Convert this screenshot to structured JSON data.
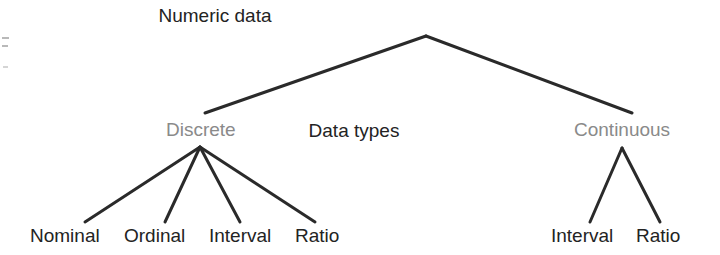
{
  "diagram": {
    "type": "tree",
    "title_node": "Numeric data",
    "center_label": "Data types",
    "branches": [
      {
        "label": "Discrete",
        "color": "#8a8a8a"
      },
      {
        "label": "Continuous",
        "color": "#8a8a8a"
      }
    ],
    "discrete_leaves": [
      {
        "label": "Nominal"
      },
      {
        "label": "Ordinal"
      },
      {
        "label": "Interval"
      },
      {
        "label": "Ratio"
      }
    ],
    "continuous_leaves": [
      {
        "label": "Interval"
      },
      {
        "label": "Ratio"
      }
    ],
    "colors": {
      "line": "#2a2a2a",
      "text": "#232323",
      "branch_text": "#8a8a8a",
      "background": "#ffffff",
      "artifact": "#b9b9b9"
    },
    "geometry": {
      "root_apex": {
        "x": 426,
        "y": 36
      },
      "discrete_top": {
        "x": 205,
        "y": 113
      },
      "continuous_top": {
        "x": 632,
        "y": 113
      },
      "discrete_fan_apex": {
        "x": 200,
        "y": 147
      },
      "continuous_fan_apex": {
        "x": 622,
        "y": 148
      },
      "leaf_line_bottom_y": 222,
      "discrete_fan_ends_x": [
        85,
        165,
        240,
        315
      ],
      "continuous_fan_ends_x": [
        590,
        660
      ],
      "line_width": 3
    }
  }
}
